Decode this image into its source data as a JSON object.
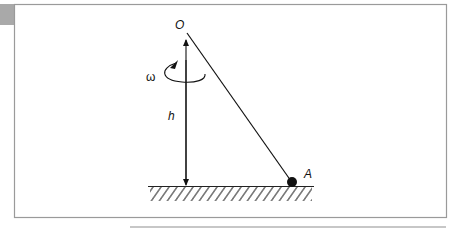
{
  "diagram": {
    "labels": {
      "pivot": "O",
      "mass": "A",
      "angular_velocity": "ω",
      "height": "h"
    },
    "colors": {
      "stroke": "#111111",
      "frame": "#9a9a9a",
      "corner_tab": "#a9a9a9"
    }
  }
}
